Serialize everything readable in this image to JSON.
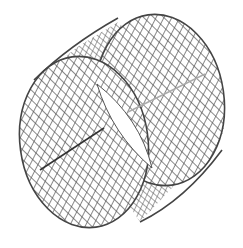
{
  "figure": {
    "background": "#ffffff",
    "mesh_color": "#555555",
    "rim_color": "#444444",
    "seam_color": "#333333",
    "seam_light_color": "#aaaaaa",
    "front_face": {
      "cx": 84,
      "cy": 142,
      "rx": 66,
      "ry": 88,
      "rotate": -8
    },
    "back_face": {
      "cx": 160,
      "cy": 100,
      "rx": 66,
      "ry": 88,
      "rotate": -8
    },
    "gap_lens": {
      "from": [
        97,
        84
      ],
      "to": [
        152,
        168
      ]
    }
  }
}
